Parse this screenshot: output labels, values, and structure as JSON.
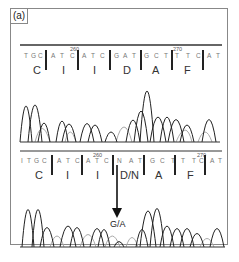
{
  "figure": {
    "panel_label": "(a)",
    "top_panel": {
      "name": "wild-type",
      "nucleotides": [
        "T",
        "G",
        "C",
        "A",
        "T",
        "C",
        "A",
        "T",
        "C",
        "G",
        "A",
        "T",
        "G",
        "C",
        "T",
        "T",
        "T",
        "C",
        "A",
        "T"
      ],
      "position_markers": [
        {
          "label": "260",
          "after_index": 5
        },
        {
          "label": "270",
          "after_index": 15
        }
      ],
      "amino_acids": [
        "C",
        "I",
        "I",
        "D",
        "A",
        "F"
      ]
    },
    "bottom_panel": {
      "name": "mutant",
      "nucleotides": [
        "I",
        "T",
        "G",
        "C",
        "A",
        "T",
        "C",
        "A",
        "T",
        "C",
        "N",
        "A",
        "T",
        "G",
        "C",
        "T",
        "T",
        "T",
        "C",
        "A",
        "T"
      ],
      "position_markers": [
        {
          "label": "260",
          "after_index": 8
        },
        {
          "label": "270",
          "after_index": 18
        }
      ],
      "amino_acids": [
        "C",
        "I",
        "I",
        "D/N",
        "A",
        "F"
      ],
      "mutation_annotation": "G/A"
    },
    "colors": {
      "trace_dark": "#222222",
      "trace_light": "#aaaaaa",
      "frame": "#888888"
    }
  }
}
